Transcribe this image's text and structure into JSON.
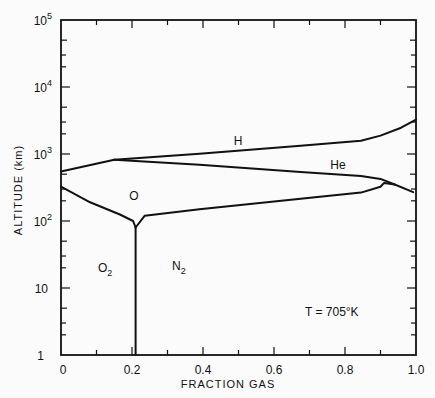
{
  "chart_data": {
    "type": "line",
    "title": "",
    "xlabel": "FRACTION GAS",
    "ylabel": "ALTITUDE (km)",
    "xlim": [
      0,
      1.0
    ],
    "ylim": [
      1,
      100000
    ],
    "yscale": "log",
    "grid": false,
    "x_ticks": [
      "0",
      "0.2",
      "0.4",
      "0.6",
      "0.8",
      "1.0"
    ],
    "x_tick_values": [
      0,
      0.2,
      0.4,
      0.6,
      0.8,
      1.0
    ],
    "y_ticks": [
      "1",
      "10",
      "10^2",
      "10^3",
      "10^4",
      "10^5"
    ],
    "y_tick_values": [
      1,
      10,
      100,
      1000,
      10000,
      100000
    ],
    "annotation": "T = 705°K",
    "region_labels": [
      {
        "label": "H",
        "x": 0.5,
        "alt_km": 1500
      },
      {
        "label": "He",
        "x": 0.78,
        "alt_km": 600
      },
      {
        "label": "O",
        "x": 0.2,
        "alt_km": 280
      },
      {
        "label": "O2",
        "x": 0.12,
        "alt_km": 18
      },
      {
        "label": "N2",
        "x": 0.32,
        "alt_km": 17
      }
    ],
    "series": [
      {
        "name": "H/He boundary",
        "points": [
          [
            0.15,
            820
          ],
          [
            0.39,
            1010
          ],
          [
            0.675,
            1330
          ],
          [
            0.845,
            1580
          ],
          [
            0.9,
            1880
          ],
          [
            0.958,
            2470
          ],
          [
            1.0,
            3260
          ]
        ]
      },
      {
        "name": "left O/He boundary",
        "points": [
          [
            0.0,
            550
          ],
          [
            0.15,
            820
          ]
        ]
      },
      {
        "name": "He/O boundary",
        "points": [
          [
            0.15,
            820
          ],
          [
            0.39,
            690
          ],
          [
            0.675,
            540
          ],
          [
            0.845,
            470
          ],
          [
            0.9,
            425
          ],
          [
            0.94,
            350
          ],
          [
            0.992,
            270
          ]
        ]
      },
      {
        "name": "O/N2 boundary",
        "points": [
          [
            0.21,
            80
          ],
          [
            0.236,
            120
          ],
          [
            0.39,
            150
          ],
          [
            0.675,
            215
          ],
          [
            0.845,
            265
          ],
          [
            0.9,
            325
          ],
          [
            0.91,
            370
          ],
          [
            0.94,
            350
          ]
        ]
      },
      {
        "name": "O/O2 boundary",
        "points": [
          [
            0.0,
            325
          ],
          [
            0.082,
            190
          ],
          [
            0.166,
            125
          ],
          [
            0.203,
            100
          ],
          [
            0.21,
            80
          ]
        ]
      },
      {
        "name": "O2/N2 boundary",
        "points": [
          [
            0.21,
            80
          ],
          [
            0.21,
            1
          ]
        ]
      }
    ]
  },
  "labels": {
    "xlabel": "FRACTION GAS",
    "ylabel": "ALTITUDE (km)",
    "annotation": "T = 705°K",
    "H": "H",
    "He": "He",
    "O": "O",
    "O2_base": "O",
    "O2_sub": "2",
    "N2_base": "N",
    "N2_sub": "2",
    "xt0": "0",
    "xt1": "0.2",
    "xt2": "0.4",
    "xt3": "0.6",
    "xt4": "0.8",
    "xt5": "1.0",
    "yt0": "1",
    "yt1": "10",
    "yt2_base": "10",
    "yt2_exp": "2",
    "yt3_base": "10",
    "yt3_exp": "3",
    "yt4_base": "10",
    "yt4_exp": "4",
    "yt5_base": "10",
    "yt5_exp": "5"
  },
  "colors": {
    "line": "#111111",
    "background": "#fbfbfb"
  }
}
